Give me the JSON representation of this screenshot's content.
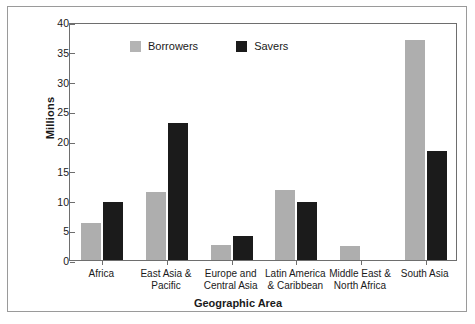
{
  "chart_data": {
    "type": "bar",
    "title": "",
    "xlabel": "Geographic Area",
    "ylabel": "Millions",
    "ylim": [
      0,
      40
    ],
    "yticks": [
      0,
      5,
      10,
      15,
      20,
      25,
      30,
      35,
      40
    ],
    "grid": false,
    "legend_position": "top-left",
    "categories": [
      "Africa",
      "East Asia & Pacific",
      "Europe and Central Asia",
      "Latin America & Caribbean",
      "Middle East & North Africa",
      "South Asia"
    ],
    "category_lines": [
      [
        "Africa"
      ],
      [
        "East Asia &",
        "Pacific"
      ],
      [
        "Europe and",
        "Central Asia"
      ],
      [
        "Latin America",
        "& Caribbean"
      ],
      [
        "Middle East &",
        "North Africa"
      ],
      [
        "South Asia"
      ]
    ],
    "series": [
      {
        "name": "Borrowers",
        "color": "#aeaeae",
        "values": [
          6.2,
          11.5,
          2.6,
          11.7,
          2.4,
          37.0
        ]
      },
      {
        "name": "Savers",
        "color": "#1b1b1b",
        "values": [
          9.8,
          23.0,
          4.0,
          9.8,
          0,
          18.4
        ]
      }
    ]
  },
  "legend": {
    "items": [
      {
        "label": "Borrowers"
      },
      {
        "label": "Savers"
      }
    ]
  },
  "colors": {
    "borrowers": "#aeaeae",
    "savers": "#1b1b1b",
    "axis": "#6e6e6e",
    "frame": "#9a9a9a",
    "text": "#1a1a1a"
  }
}
